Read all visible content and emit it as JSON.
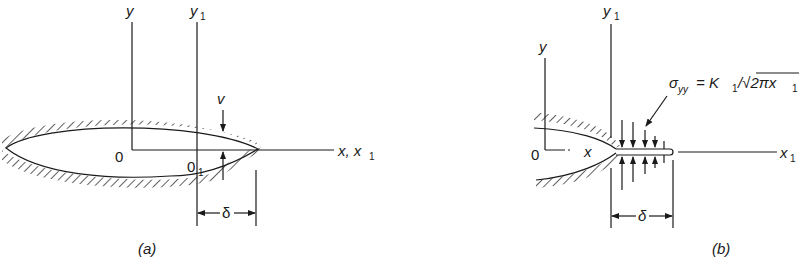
{
  "figure_a": {
    "y_axis_label": "y",
    "y1_axis_label": "y",
    "y1_subscript": "1",
    "origin_label": "0",
    "origin1_label": "0",
    "origin1_subscript": "1",
    "x_axis_label": "x, x",
    "x_axis_subscript": "1",
    "displacement_label": "v",
    "zone_label": "δ",
    "caption": "(a)"
  },
  "figure_b": {
    "y_axis_label": "y",
    "y1_axis_label": "y",
    "y1_subscript": "1",
    "origin_label": "0",
    "x_label": "x",
    "x1_label": "x",
    "x1_subscript": "1",
    "stress_symbol": "σ",
    "stress_subscript": "yy",
    "stress_equation": "= K",
    "stress_k_subscript": "1",
    "stress_rest": "/√2πx",
    "stress_rest_subscript": "1",
    "zone_label": "δ",
    "caption": "(b)"
  }
}
